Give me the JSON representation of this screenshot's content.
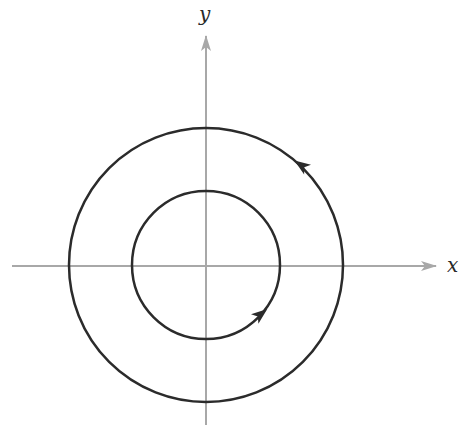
{
  "diagram": {
    "type": "phase-portrait",
    "axes": {
      "x_label": "x",
      "y_label": "y",
      "color": "#a8a8a8"
    },
    "origin_px": [
      206,
      265
    ],
    "orbits": [
      {
        "name": "inner",
        "radius_px": 74,
        "direction": "counterclockwise",
        "arrow_angle_deg": -55
      },
      {
        "name": "outer",
        "radius_px": 137,
        "direction": "counterclockwise",
        "arrow_angle_deg": 55
      }
    ],
    "curve_color": "#2b2b2b"
  }
}
